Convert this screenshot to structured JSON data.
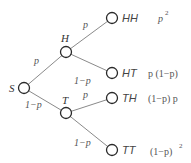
{
  "diagram": {
    "nodes": {
      "root": {
        "label": "S"
      },
      "h": {
        "label": "H"
      },
      "t": {
        "label": "T"
      }
    },
    "edges": {
      "s_h": "p",
      "s_t": "1−p",
      "h_hh": "p",
      "h_ht": "1−p",
      "t_th": "p",
      "t_tt": "1−p"
    },
    "outcomes": [
      {
        "label": "HH",
        "prob": "p",
        "prob_sup": "2"
      },
      {
        "label": "HT",
        "prob": "p (1−p)",
        "prob_sup": ""
      },
      {
        "label": "TH",
        "prob": "(1−p) p",
        "prob_sup": ""
      },
      {
        "label": "TT",
        "prob": "(1−p)",
        "prob_sup": "2"
      }
    ],
    "colors": {
      "edge": "#8a8a8a",
      "node": "#2a2a2a",
      "text": "#555555"
    }
  }
}
